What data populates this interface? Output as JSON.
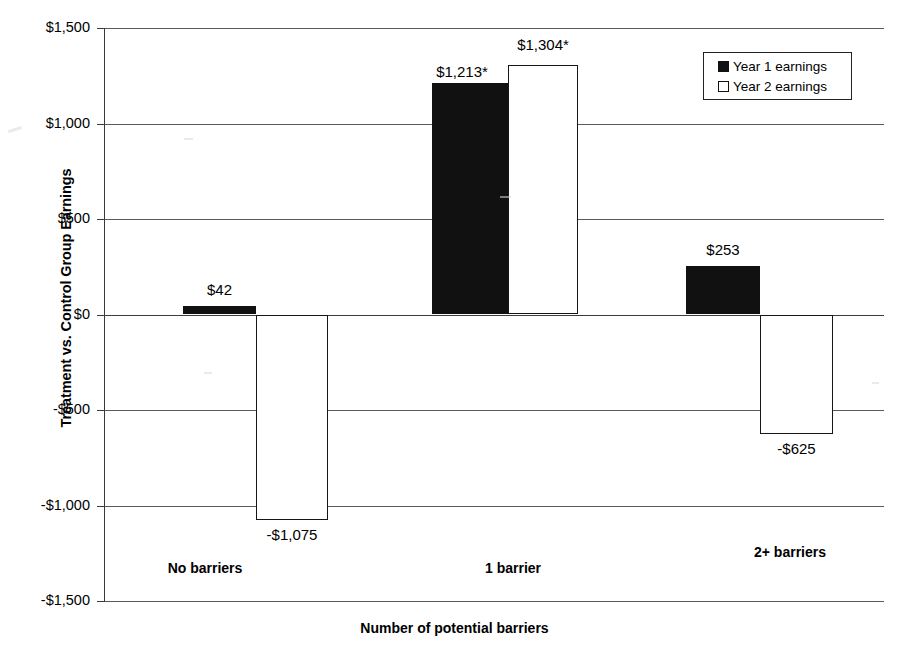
{
  "chart_data": {
    "type": "bar",
    "title": "",
    "xlabel": "Number of potential barriers",
    "ylabel": "Treatment vs. Control Group Earnings",
    "categories": [
      "No barriers",
      "1 barrier",
      "2+ barriers"
    ],
    "series": [
      {
        "name": "Year 1 earnings",
        "color": "#111111",
        "values": [
          42,
          1213,
          253
        ],
        "labels": [
          "$42",
          "$1,213*",
          "$253"
        ]
      },
      {
        "name": "Year 2 earnings",
        "color": "#ffffff",
        "values": [
          -1075,
          1304,
          -625
        ],
        "labels": [
          "-$1,075",
          "$1,304*",
          "-$625"
        ]
      }
    ],
    "ylim": [
      -1500,
      1500
    ],
    "ytick_values": [
      1500,
      1000,
      500,
      0,
      -500,
      -1000,
      -1500
    ],
    "ytick_labels": [
      "$1,500",
      "$1,000",
      "$500",
      "$0",
      "-$500",
      "-$1,000",
      "-$1,500"
    ],
    "grid": true,
    "legend_position": "top-right",
    "annotations": [
      "* denotes statistical significance"
    ]
  },
  "legend": {
    "items": [
      {
        "label": "Year 1 earnings",
        "swatch": "filled-square"
      },
      {
        "label": "Year 2 earnings",
        "swatch": "hollow-square"
      }
    ]
  }
}
